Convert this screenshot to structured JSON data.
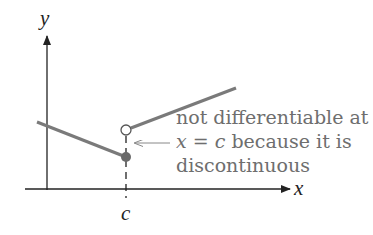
{
  "diagram": {
    "axes": {
      "x_label": "x",
      "y_label": "y",
      "tick_label": "c"
    },
    "annotation": {
      "lines": [
        "not differentiable at",
        "x = c because it is",
        "discontinuous"
      ],
      "line1": "not differentiable at",
      "line2_var": "x",
      "line2_eq": " = ",
      "line2_c": "c",
      "line2_rest": " because it is",
      "line3": "discontinuous"
    },
    "colors": {
      "curve": "#7a7a7a",
      "axis": "#222222",
      "text": "#6e6e6e",
      "filled_point": "#6a6a6a"
    },
    "elements": {
      "left_segment": "line ending at filled point at x = c",
      "right_segment": "line starting at open circle above x = c",
      "filled_point": "f(c)",
      "open_point": "removed limit value"
    }
  }
}
